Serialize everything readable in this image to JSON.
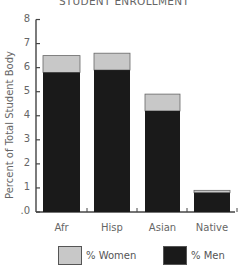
{
  "chart_data": {
    "type": "bar",
    "stacked": true,
    "title": "STUDENT ENROLLMENT",
    "xlabel": "",
    "ylabel": "Percent of Total Student Body",
    "ylim": [
      0,
      8
    ],
    "yticks": [
      0,
      1,
      2,
      3,
      4,
      5,
      6,
      7,
      8
    ],
    "ytick_labels": [
      ".0",
      "1",
      "2",
      "3",
      "4",
      "5",
      "6",
      "7",
      "8"
    ],
    "categories": [
      "Afr",
      "Hisp",
      "Asian",
      "Native"
    ],
    "series": [
      {
        "name": "% Men",
        "color": "#1a1a1a",
        "values": [
          5.8,
          5.9,
          4.2,
          0.8
        ]
      },
      {
        "name": "% Women",
        "color": "#c8c8c8",
        "values": [
          0.7,
          0.7,
          0.7,
          0.1
        ]
      }
    ],
    "totals": [
      6.5,
      6.6,
      4.9,
      0.9
    ],
    "grid": false,
    "legend_position": "bottom"
  },
  "legend": {
    "women_label": "% Women",
    "men_label": "% Men"
  },
  "colors": {
    "women": "#c8c8c8",
    "men": "#1a1a1a",
    "axis": "#444444"
  }
}
